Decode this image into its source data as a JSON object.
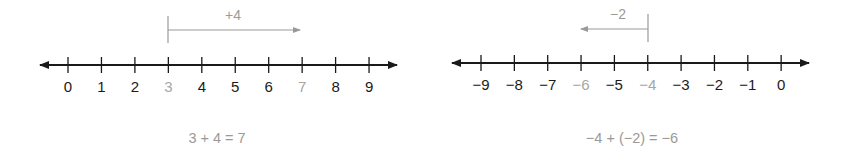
{
  "colors": {
    "axis": "#1a1a1a",
    "label": "#1a1a1a",
    "highlight": "#a6a6a6",
    "jump": "#9a9a9a",
    "equation": "#9a9a9a"
  },
  "left": {
    "ticks": [
      "0",
      "1",
      "2",
      "3",
      "4",
      "5",
      "6",
      "7",
      "8",
      "9"
    ],
    "highlighted": [
      "3",
      "7"
    ],
    "jump": {
      "label": "+4",
      "from": "3",
      "to": "7",
      "direction": "right"
    },
    "equation": "3 + 4 = 7"
  },
  "right": {
    "ticks": [
      "−9",
      "−8",
      "−7",
      "−6",
      "−5",
      "−4",
      "−3",
      "−2",
      "−1",
      "0"
    ],
    "highlighted": [
      "−6",
      "−4"
    ],
    "jump": {
      "label": "−2",
      "from": "−4",
      "to": "−6",
      "direction": "left"
    },
    "equation": "−4 + (−2) = −6"
  }
}
